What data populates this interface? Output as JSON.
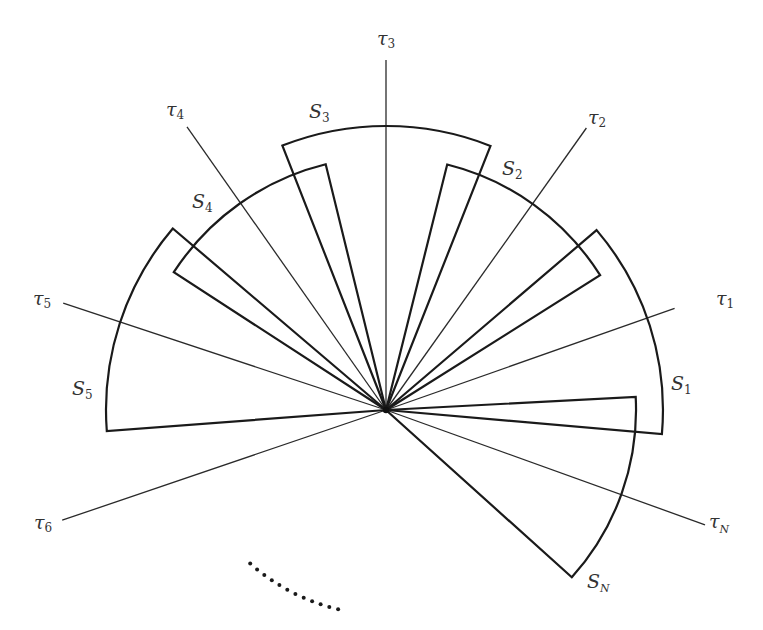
{
  "diagram": {
    "sectors": [
      {
        "id": "S1",
        "symbol": "S",
        "subscript": "1"
      },
      {
        "id": "S2",
        "symbol": "S",
        "subscript": "2"
      },
      {
        "id": "S3",
        "symbol": "S",
        "subscript": "3"
      },
      {
        "id": "S4",
        "symbol": "S",
        "subscript": "4"
      },
      {
        "id": "S5",
        "symbol": "S",
        "subscript": "5"
      },
      {
        "id": "SN",
        "symbol": "S",
        "subscript": "N"
      }
    ],
    "rays": [
      {
        "id": "tau1",
        "symbol": "τ",
        "subscript": "1"
      },
      {
        "id": "tau2",
        "symbol": "τ",
        "subscript": "2"
      },
      {
        "id": "tau3",
        "symbol": "τ",
        "subscript": "3"
      },
      {
        "id": "tau4",
        "symbol": "τ",
        "subscript": "4"
      },
      {
        "id": "tau5",
        "symbol": "τ",
        "subscript": "5"
      },
      {
        "id": "tau6",
        "symbol": "τ",
        "subscript": "6"
      },
      {
        "id": "tauN",
        "symbol": "τ",
        "subscript": "N"
      }
    ],
    "ellipsis": {
      "dot_count": 12,
      "meaning": "continuation"
    }
  }
}
